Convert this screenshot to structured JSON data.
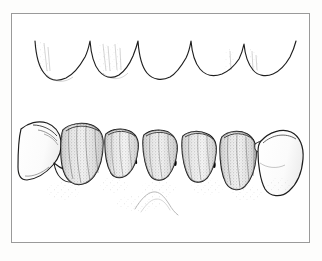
{
  "figure": {
    "kind": "line-drawing",
    "background_color": "#fdfdfc",
    "panel_color": "#ffffff",
    "frame_color": "#9a9a9a",
    "ink_color": "#1a1a1a",
    "shade_color": "#b6b6b6",
    "shadow_color": "#000000",
    "stipple_color": "#8d8d8d"
  },
  "upper_arch": {
    "label": "opposing maxillary gingival contour",
    "description": "scalloped gingival margin line with four interdental papillae",
    "papillae_count": 5,
    "span_x": [
      24,
      288
    ],
    "baseline_y": 72
  },
  "prosthesis": {
    "label": "fixed partial denture",
    "abutments": [
      {
        "position": "left",
        "label": "left abutment tooth",
        "shaded": false
      },
      {
        "position": "right",
        "label": "right abutment tooth",
        "shaded": false
      }
    ],
    "retainers_and_pontics": [
      {
        "index": 1,
        "label": "retainer crown",
        "shaded": true
      },
      {
        "index": 2,
        "label": "pontic",
        "shaded": true
      },
      {
        "index": 3,
        "label": "pontic",
        "shaded": true
      },
      {
        "index": 4,
        "label": "pontic",
        "shaded": true
      },
      {
        "index": 5,
        "label": "retainer crown",
        "shaded": true
      }
    ],
    "embrasure_shadows": 4,
    "ridge_outline": "faint stippled residual ridge beneath pontics"
  },
  "caption": {
    "text": "",
    "visible": "cropped",
    "note": "caption row clipped at image edge; only letter tops remain"
  }
}
